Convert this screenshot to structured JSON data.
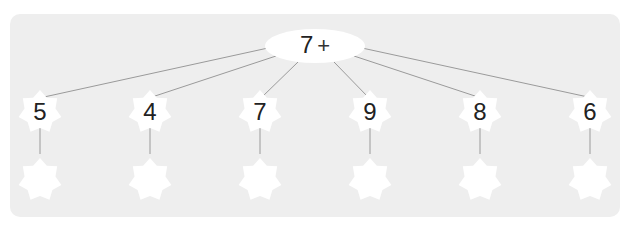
{
  "exercise": {
    "top_number": "7",
    "operator": "+",
    "addends": [
      "5",
      "4",
      "7",
      "9",
      "8",
      "6"
    ],
    "answers": [
      "",
      "",
      "",
      "",
      "",
      ""
    ]
  },
  "colors": {
    "panel": "#eeeeee",
    "shape_fill": "#ffffff",
    "line": "#999999",
    "text": "#222222"
  }
}
